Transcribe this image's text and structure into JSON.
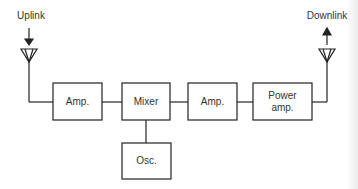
{
  "diagram": {
    "type": "block-diagram",
    "labels": {
      "uplink": "Uplink",
      "downlink": "Downlink"
    },
    "blocks": [
      {
        "id": "amp1",
        "label": "Amp."
      },
      {
        "id": "mixer",
        "label": "Mixer"
      },
      {
        "id": "amp2",
        "label": "Amp."
      },
      {
        "id": "power_amp",
        "label": "Power\namp."
      },
      {
        "id": "osc",
        "label": "Osc."
      }
    ],
    "power_amp_line1": "Power",
    "power_amp_line2": "amp.",
    "connections": [
      [
        "uplink-antenna",
        "amp1"
      ],
      [
        "amp1",
        "mixer"
      ],
      [
        "osc",
        "mixer"
      ],
      [
        "mixer",
        "amp2"
      ],
      [
        "amp2",
        "power_amp"
      ],
      [
        "power_amp",
        "downlink-antenna"
      ]
    ],
    "colors": {
      "line": "#222222",
      "text": "#333333",
      "background": "#ffffff"
    }
  }
}
